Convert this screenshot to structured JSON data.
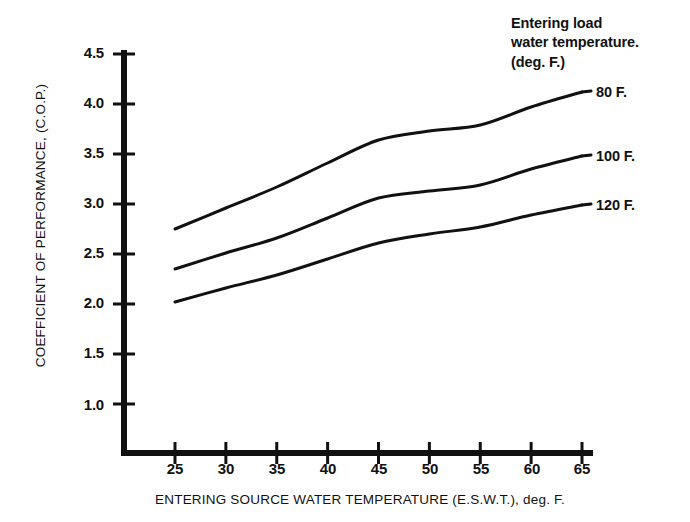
{
  "chart_data": {
    "type": "line",
    "title": "",
    "xlabel": "ENTERING SOURCE WATER TEMPERATURE (E.S.W.T.), deg. F.",
    "ylabel": "COEFFICIENT OF PERFORMANCE, (C.O.P.)",
    "xlim": [
      25,
      65
    ],
    "ylim": [
      1.0,
      4.5
    ],
    "xticks": [
      "25",
      "30",
      "35",
      "40",
      "45",
      "50",
      "55",
      "60",
      "65"
    ],
    "yticks": [
      "1.0",
      "1.5",
      "2.0",
      "2.5",
      "3.0",
      "3.5",
      "4.0",
      "4.5"
    ],
    "grid": false,
    "legend_position": "right-of-curves",
    "legend_title": "Entering load water temperature. (deg. F.)",
    "legend_title_lines": [
      "Entering load",
      "water temperature.",
      "(deg. F.)"
    ],
    "x": [
      25,
      30,
      35,
      40,
      45,
      50,
      55,
      60,
      65
    ],
    "series": [
      {
        "name": "80 F.",
        "label": "80 F.",
        "color": "#111111",
        "values": [
          2.75,
          2.96,
          3.17,
          3.41,
          3.64,
          3.73,
          3.79,
          3.97,
          4.12
        ]
      },
      {
        "name": "100 F.",
        "label": "100 F.",
        "color": "#111111",
        "values": [
          2.35,
          2.51,
          2.66,
          2.86,
          3.06,
          3.13,
          3.19,
          3.35,
          3.48
        ]
      },
      {
        "name": "120 F.",
        "label": "120 F.",
        "color": "#111111",
        "values": [
          2.02,
          2.16,
          2.29,
          2.45,
          2.61,
          2.7,
          2.77,
          2.89,
          2.99
        ]
      }
    ]
  },
  "axis": {
    "y_title": "COEFFICIENT OF PERFORMANCE, (C.O.P.)",
    "x_title": "ENTERING SOURCE WATER TEMPERATURE (E.S.W.T.), deg. F.",
    "y_tick_labels": [
      "4.5",
      "4.0",
      "3.5",
      "3.0",
      "2.5",
      "2.0",
      "1.5",
      "1.0"
    ],
    "x_tick_labels": [
      "25",
      "30",
      "35",
      "40",
      "45",
      "50",
      "55",
      "60",
      "65"
    ]
  },
  "legend": {
    "line1": "Entering load",
    "line2": "water temperature.",
    "line3": "(deg. F.)",
    "items": [
      {
        "label": "80 F."
      },
      {
        "label": "100 F."
      },
      {
        "label": "120 F."
      }
    ]
  },
  "colors": {
    "background": "#ffffff",
    "ink": "#111111",
    "curve": "#111111"
  }
}
